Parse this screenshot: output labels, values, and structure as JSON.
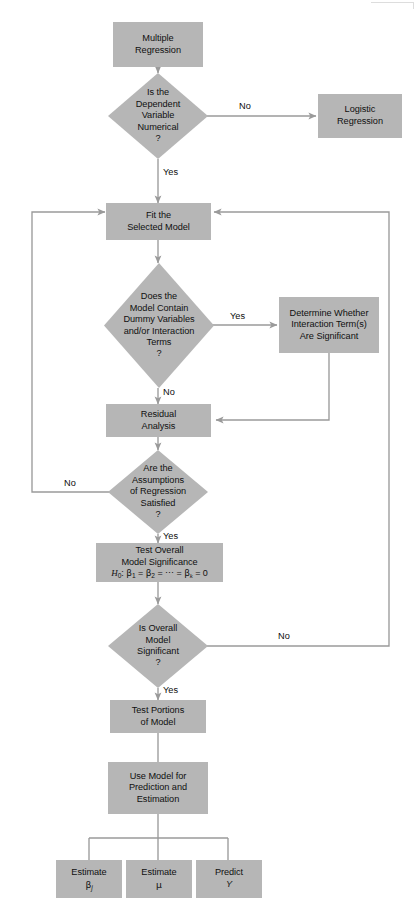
{
  "diagram": {
    "colors": {
      "box_fill": "#b6b6b6",
      "connector": "#9a9a9a",
      "text": "#101010",
      "background": "#ffffff"
    },
    "nodes": {
      "multiple_regression": {
        "line1": "Multiple",
        "line2": "Regression"
      },
      "is_dependent_numerical": {
        "line1": "Is the",
        "line2": "Dependent",
        "line3": "Variable",
        "line4": "Numerical",
        "line5": "?"
      },
      "logistic_regression": {
        "line1": "Logistic",
        "line2": "Regression"
      },
      "fit_selected_model": {
        "line1": "Fit the",
        "line2": "Selected Model"
      },
      "does_model_contain": {
        "line1": "Does the",
        "line2": "Model Contain",
        "line3": "Dummy Variables",
        "line4": "and/or Interaction",
        "line5": "Terms",
        "line6": "?"
      },
      "determine_interaction": {
        "line1": "Determine Whether",
        "line2": "Interaction Term(s)",
        "line3": "Are Significant"
      },
      "residual_analysis": {
        "line1": "Residual",
        "line2": "Analysis"
      },
      "assumptions_satisfied": {
        "line1": "Are the",
        "line2": "Assumptions",
        "line3": "of Regression",
        "line4": "Satisfied",
        "line5": "?"
      },
      "test_overall_significance": {
        "line1": "Test Overall",
        "line2": "Model Significance",
        "formula": "H0: B1 = B2 = ... = Bk = 0"
      },
      "is_overall_significant": {
        "line1": "Is Overall",
        "line2": "Model",
        "line3": "Significant",
        "line4": "?"
      },
      "test_portions": {
        "line1": "Test Portions",
        "line2": "of Model"
      },
      "use_model": {
        "line1": "Use Model for",
        "line2": "Prediction and",
        "line3": "Estimation"
      },
      "estimate_beta": {
        "line1": "Estimate",
        "line2": "βj"
      },
      "estimate_mu": {
        "line1": "Estimate",
        "line2": "μ"
      },
      "predict_y": {
        "line1": "Predict",
        "line2": "Y"
      }
    },
    "edge_labels": {
      "numerical_no": "No",
      "numerical_yes": "Yes",
      "dummy_yes": "Yes",
      "dummy_no": "No",
      "assumptions_no": "No",
      "assumptions_yes": "Yes",
      "overall_no": "No",
      "overall_yes": "Yes"
    }
  }
}
